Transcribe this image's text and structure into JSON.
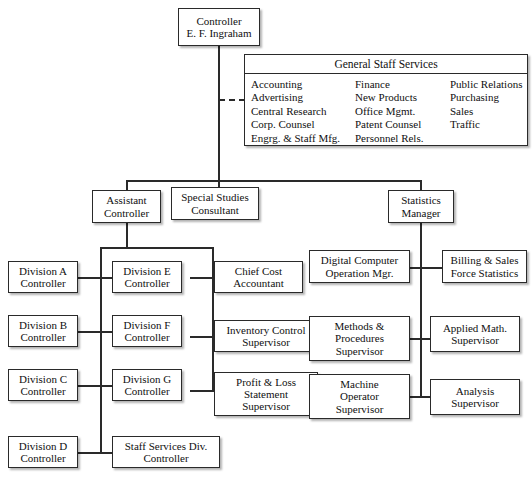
{
  "chart": {
    "root": {
      "name": "controller",
      "lines": [
        "Controller",
        "E. F. Ingraham"
      ]
    },
    "staff_services": {
      "title": "General Staff Services",
      "columns": [
        [
          "Accounting",
          "Advertising",
          "Central Research",
          "Corp. Counsel",
          "Engrg. & Staff Mfg."
        ],
        [
          "Finance",
          "New Products",
          "Office Mgmt.",
          "Patent Counsel",
          "Personnel Rels."
        ],
        [
          "Public Relations",
          "Purchasing",
          "Sales",
          "Traffic"
        ]
      ]
    },
    "second_level": [
      {
        "name": "assistant-controller",
        "lines": [
          "Assistant",
          "Controller"
        ]
      },
      {
        "name": "special-studies-consultant",
        "lines": [
          "Special Studies",
          "Consultant"
        ]
      },
      {
        "name": "statistics-manager",
        "lines": [
          "Statistics",
          "Manager"
        ]
      }
    ],
    "division_column_left": [
      {
        "name": "division-a-controller",
        "lines": [
          "Division A",
          "Controller"
        ]
      },
      {
        "name": "division-b-controller",
        "lines": [
          "Division B",
          "Controller"
        ]
      },
      {
        "name": "division-c-controller",
        "lines": [
          "Division C",
          "Controller"
        ]
      },
      {
        "name": "division-d-controller",
        "lines": [
          "Division D",
          "Controller"
        ]
      }
    ],
    "division_column_middle": [
      {
        "name": "division-e-controller",
        "lines": [
          "Division E",
          "Controller"
        ]
      },
      {
        "name": "division-f-controller",
        "lines": [
          "Division F",
          "Controller"
        ]
      },
      {
        "name": "division-g-controller",
        "lines": [
          "Division G",
          "Controller"
        ]
      },
      {
        "name": "staff-services-div-controller",
        "lines": [
          "Staff Services Div.",
          "Controller"
        ]
      }
    ],
    "cost_column": [
      {
        "name": "chief-cost-accountant",
        "lines": [
          "Chief Cost",
          "Accountant"
        ]
      },
      {
        "name": "inventory-control-supervisor",
        "lines": [
          "Inventory Control",
          "Supervisor"
        ]
      },
      {
        "name": "profit-loss-statement-supervisor",
        "lines": [
          "Profit & Loss",
          "Statement",
          "Supervisor"
        ]
      }
    ],
    "statistics_left": [
      {
        "name": "digital-computer-operation-mgr",
        "lines": [
          "Digital Computer",
          "Operation Mgr."
        ]
      },
      {
        "name": "methods-procedures-supervisor",
        "lines": [
          "Methods &",
          "Procedures",
          "Supervisor"
        ]
      },
      {
        "name": "machine-operator-supervisor",
        "lines": [
          "Machine",
          "Operator",
          "Supervisor"
        ]
      }
    ],
    "statistics_right": [
      {
        "name": "billing-sales-force-statistics",
        "lines": [
          "Billing & Sales",
          "Force Statistics"
        ]
      },
      {
        "name": "applied-math-supervisor",
        "lines": [
          "Applied Math.",
          "Supervisor"
        ]
      },
      {
        "name": "analysis-supervisor",
        "lines": [
          "Analysis",
          "Supervisor"
        ]
      }
    ],
    "colors": {
      "line": "#2a2a2a",
      "box_border": "#2a2a2a",
      "background": "#ffffff",
      "text": "#101010"
    }
  }
}
